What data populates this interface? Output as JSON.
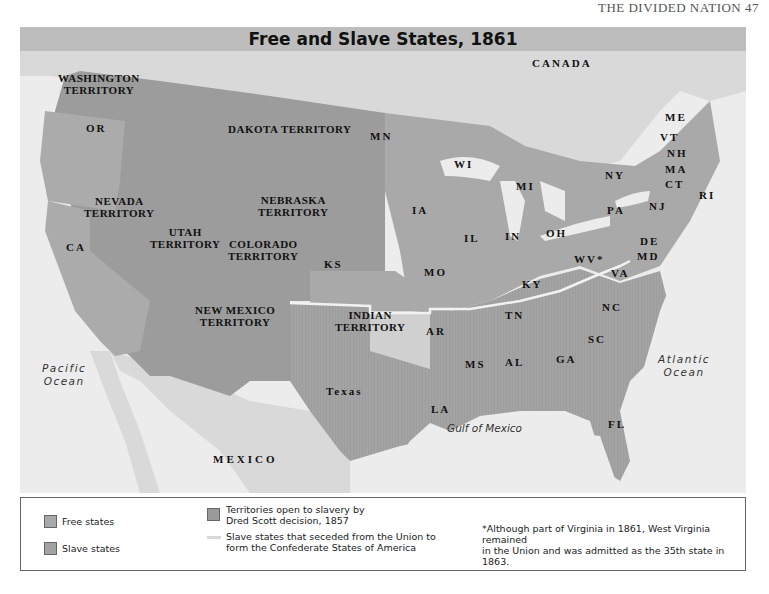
{
  "page": {
    "running_head": "THE DIVIDED NATION    47"
  },
  "map": {
    "title": "Free and Slave States, 1861",
    "colors": {
      "background": "#e4e4e4",
      "title_bar": "#bdbdbd",
      "free_states": "#a9a9a9",
      "slave_states": "#a3a3a3",
      "dred_scott_territories": "#9a9a9a",
      "indian_territory": "#d0d0d0",
      "foreign_land": "#d9d9d9",
      "water": "#eeeeee",
      "confederate_border": "#f2f2f2"
    },
    "labels": {
      "canada": "CANADA",
      "mexico": "MEXICO",
      "pacific": [
        "Pacific",
        "Ocean"
      ],
      "atlantic": [
        "Atlantic",
        "Ocean"
      ],
      "gulf": "Gulf of Mexico",
      "washington": [
        "WASHINGTON",
        "TERRITORY"
      ],
      "dakota": "DAKOTA TERRITORY",
      "nevada": [
        "NEVADA",
        "TERRITORY"
      ],
      "utah": [
        "UTAH",
        "TERRITORY"
      ],
      "colorado": [
        "COLORADO",
        "TERRITORY"
      ],
      "nebraska": [
        "NEBRASKA",
        "TERRITORY"
      ],
      "new_mexico": [
        "NEW MEXICO",
        "TERRITORY"
      ],
      "indian": [
        "INDIAN",
        "TERRITORY"
      ],
      "texas": "Texas",
      "states": {
        "OR": "OR",
        "CA": "CA",
        "KS": "KS",
        "MN": "MN",
        "WI": "WI",
        "MI": "MI",
        "IA": "IA",
        "IL": "IL",
        "IN": "IN",
        "OH": "OH",
        "MO": "MO",
        "KY": "KY",
        "WV": "WV*",
        "VA": "VA",
        "PA": "PA",
        "NY": "NY",
        "NJ": "NJ",
        "DE": "DE",
        "MD": "MD",
        "VT": "VT",
        "NH": "NH",
        "MA": "MA",
        "CT": "CT",
        "RI": "RI",
        "ME": "ME",
        "TN": "TN",
        "NC": "NC",
        "SC": "SC",
        "AR": "AR",
        "MS": "MS",
        "AL": "AL",
        "GA": "GA",
        "LA": "LA",
        "FL": "FL"
      }
    }
  },
  "legend": {
    "free_states": "Free states",
    "slave_states": "Slave states",
    "territories": [
      "Territories open to slavery by",
      "Dred Scott decision, 1857"
    ],
    "seceded": [
      "Slave states that seceded from the Union to",
      "form the Confederate States of America"
    ],
    "footnote": [
      "*Although part of Virginia in 1861, West Virginia remained",
      "in the Union and was admitted as the 35th state in 1863."
    ]
  }
}
